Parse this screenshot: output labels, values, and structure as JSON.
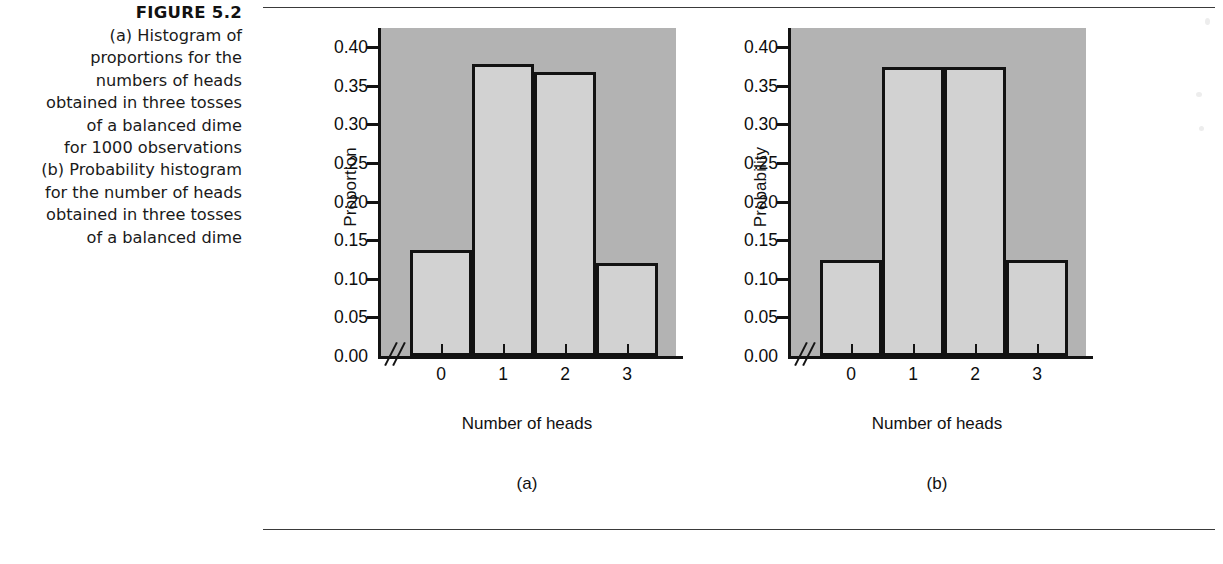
{
  "figure": {
    "number": "FIGURE 5.2",
    "caption_lines": [
      "(a) Histogram of",
      "proportions for the",
      "numbers of heads",
      "obtained in three tosses",
      "of a balanced dime",
      "for 1000 observations",
      "(b) Probability histogram",
      "for the number of heads",
      "obtained in three tosses",
      "of a balanced dime"
    ]
  },
  "colors": {
    "plot_background": "#b3b3b3",
    "bar_fill": "#d2d2d2",
    "bar_outline": "#121212",
    "axis": "#131313",
    "page_background": "#ffffff",
    "rule": "#3a3a3a"
  },
  "chart_data": [
    {
      "type": "bar",
      "panel_label": "(a)",
      "title": "",
      "xlabel": "Number of heads",
      "ylabel": "Proportion",
      "categories": [
        "0",
        "1",
        "2",
        "3"
      ],
      "values": [
        0.137,
        0.378,
        0.368,
        0.12
      ],
      "ylim": [
        0.0,
        0.425
      ],
      "yticks": [
        0.0,
        0.05,
        0.1,
        0.15,
        0.2,
        0.25,
        0.3,
        0.35,
        0.4
      ],
      "ytick_labels": [
        "0.00",
        "0.05",
        "0.10",
        "0.15",
        "0.20",
        "0.25",
        "0.30",
        "0.35",
        "0.40"
      ],
      "xtick_labels": [
        "0",
        "1",
        "2",
        "3"
      ],
      "grid": false,
      "legend": null,
      "x_axis_break": true
    },
    {
      "type": "bar",
      "panel_label": "(b)",
      "title": "",
      "xlabel": "Number of heads",
      "ylabel": "Probability",
      "categories": [
        "0",
        "1",
        "2",
        "3"
      ],
      "values": [
        0.125,
        0.375,
        0.375,
        0.125
      ],
      "ylim": [
        0.0,
        0.425
      ],
      "yticks": [
        0.0,
        0.05,
        0.1,
        0.15,
        0.2,
        0.25,
        0.3,
        0.35,
        0.4
      ],
      "ytick_labels": [
        "0.00",
        "0.05",
        "0.10",
        "0.15",
        "0.20",
        "0.25",
        "0.30",
        "0.35",
        "0.40"
      ],
      "xtick_labels": [
        "0",
        "1",
        "2",
        "3"
      ],
      "grid": false,
      "legend": null,
      "x_axis_break": true
    }
  ]
}
